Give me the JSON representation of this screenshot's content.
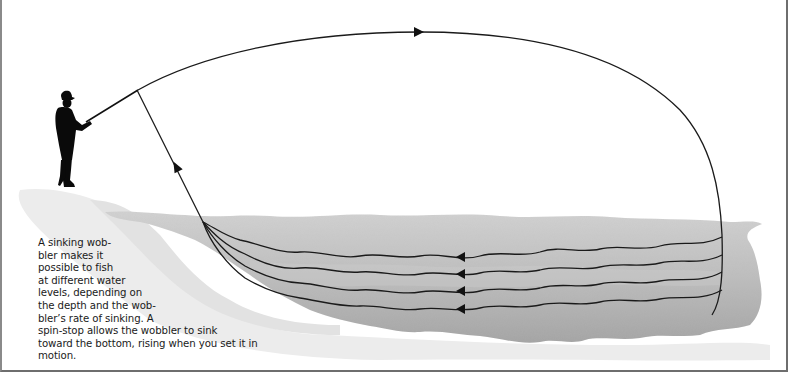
{
  "figure": {
    "caption_lines": [
      "A sinking wob-",
      "bler makes it",
      "possible to fish",
      "at different water",
      "levels, depending on",
      "the depth and the wob-",
      "bler’s rate of sinking. A",
      "spin-stop allows the wobbler to sink",
      "toward the bottom, rising when you set it in",
      "motion."
    ],
    "elements": {
      "angler": "angler-silhouette",
      "cast_arc": "casting-trajectory-arc",
      "retrieve_paths": [
        "retrieve-path-level-1",
        "retrieve-path-level-2",
        "retrieve-path-level-3",
        "retrieve-path-level-4"
      ],
      "water": "water-body-shading"
    },
    "colors": {
      "line": "#1a1a1a",
      "water_dark": "#9a9a9a",
      "water_light": "#c8c8c8",
      "frame": "#6e6e6e"
    }
  }
}
